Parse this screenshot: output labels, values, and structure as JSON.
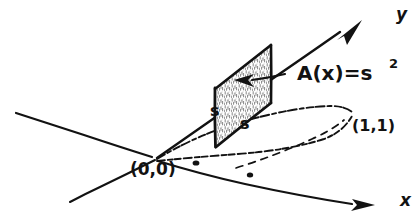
{
  "figure": {
    "style": "hand-drawn pen sketch",
    "ink_color": "#121212",
    "paper_color": "#ffffff",
    "width": 419,
    "height": 223
  },
  "axes": {
    "y_axis": {
      "label": "y",
      "label_x": 396,
      "label_y": 20,
      "arrow": true,
      "direction": "upper-right"
    },
    "x_axis": {
      "label": "x",
      "label_x": 400,
      "label_y": 206,
      "arrow": true,
      "direction": "lower-right"
    }
  },
  "annotations": {
    "origin": {
      "text": "(0,0)",
      "x": 130,
      "y": 175
    },
    "corner_point": {
      "text": "(1,1)",
      "x": 352,
      "y": 131
    },
    "area_label": {
      "text": "A(x)=s",
      "exponent": "2",
      "x": 297,
      "y": 80
    },
    "side_left": {
      "text": "s",
      "x": 210,
      "y": 116
    },
    "side_bottom": {
      "text": "s",
      "x": 240,
      "y": 129
    }
  },
  "cross_section": {
    "shape": "square",
    "side_length_symbol": "s",
    "area_formula": "A(x) = s^2",
    "fill": "hatched/stippled",
    "orientation": "vertical, perpendicular to x-axis"
  },
  "base_region": {
    "shape": "lens",
    "boundary_curves": 2,
    "dashed_interior_line": true,
    "marker_dots": 2
  }
}
